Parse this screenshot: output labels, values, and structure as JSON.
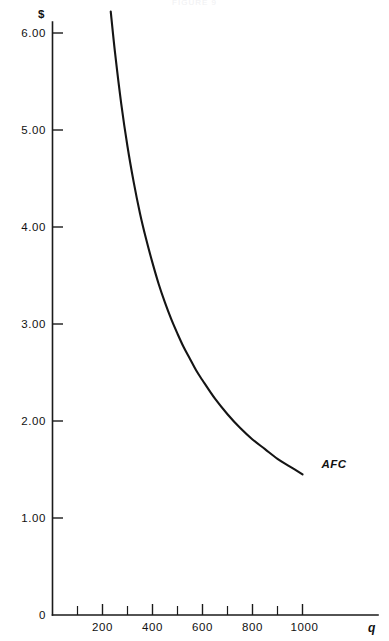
{
  "figure": {
    "faint_header": "FIGURE 9",
    "background_color": "#ffffff",
    "ink_color": "#141414"
  },
  "chart_data": {
    "type": "line",
    "title": "",
    "subtitle": "",
    "xlabel": "q",
    "ylabel": "$",
    "xlim": [
      0,
      1300
    ],
    "ylim": [
      0,
      6.2
    ],
    "grid": false,
    "legend_position": "inline-right-end",
    "annotations": [
      {
        "text": "AFC",
        "x": 1060,
        "y": 1.56,
        "style": "bold-italic"
      }
    ],
    "x_ticks_major": [
      200,
      400,
      600,
      800,
      1000
    ],
    "x_tick_labels": [
      "200",
      "400",
      "600",
      "800",
      "1000"
    ],
    "x_ticks_minor": [
      100,
      300,
      500,
      700,
      900
    ],
    "y_ticks": [
      0,
      1,
      2,
      3,
      4,
      5,
      6
    ],
    "y_tick_labels": [
      "0",
      "1.00",
      "2.00",
      "3.00",
      "4.00",
      "5.00",
      "6.00"
    ],
    "series": [
      {
        "name": "AFC",
        "label": "AFC",
        "color": "#141414",
        "relationship": "AFC = FC / q, FC = 1450",
        "x": [
          233,
          250,
          275,
          300,
          325,
          350,
          375,
          400,
          425,
          450,
          475,
          500,
          525,
          550,
          575,
          600,
          650,
          700,
          750,
          800,
          850,
          900,
          950,
          1000
        ],
        "values": [
          6.22,
          5.8,
          5.27,
          4.83,
          4.46,
          4.14,
          3.87,
          3.63,
          3.41,
          3.22,
          3.05,
          2.9,
          2.76,
          2.64,
          2.52,
          2.42,
          2.23,
          2.07,
          1.93,
          1.81,
          1.71,
          1.61,
          1.53,
          1.45
        ]
      }
    ]
  },
  "axes": {
    "y_axis_title": "$",
    "x_axis_title": "q",
    "origin_label": "0"
  }
}
